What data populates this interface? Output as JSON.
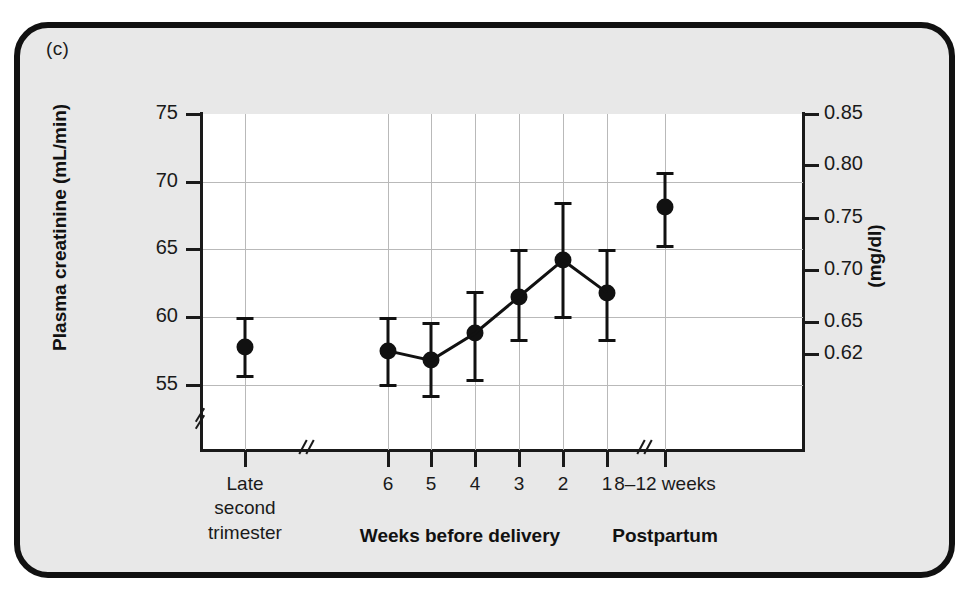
{
  "panel": {
    "label": "(c)"
  },
  "chart_data": {
    "type": "scatter",
    "title": "",
    "ylabel": "Plasma creatinine (mL/min)",
    "ylabel_right": "(mg/dl)",
    "xlabel": "",
    "ylim": [
      53,
      75
    ],
    "ylim_right": [
      0.615,
      0.85
    ],
    "grid": true,
    "legend": null,
    "axis_break_y": true,
    "axis_break_x": true,
    "yticks_left": [
      "75",
      "70",
      "65",
      "60",
      "55"
    ],
    "yticks_left_values": [
      75,
      70,
      65,
      60,
      55
    ],
    "yticks_right": [
      "0.85",
      "0.80",
      "0.75",
      "0.70",
      "0.65",
      "0.62"
    ],
    "yticks_right_values": [
      0.85,
      0.8,
      0.75,
      0.7,
      0.65,
      0.62
    ],
    "group_labels": [
      {
        "text": "Weeks before delivery",
        "x": 460
      },
      {
        "text": "Postpartum",
        "x": 665
      }
    ],
    "categories": [
      "Late second trimester",
      "6",
      "5",
      "4",
      "3",
      "2",
      "1",
      "8–12 weeks"
    ],
    "tick_labels": [
      {
        "lines": [
          "Late",
          "second",
          "trimester"
        ],
        "x": 245
      },
      {
        "lines": [
          "6"
        ],
        "x": 388
      },
      {
        "lines": [
          "5"
        ],
        "x": 431
      },
      {
        "lines": [
          "4"
        ],
        "x": 475
      },
      {
        "lines": [
          "3"
        ],
        "x": 519
      },
      {
        "lines": [
          "2"
        ],
        "x": 563
      },
      {
        "lines": [
          "1"
        ],
        "x": 607
      },
      {
        "lines": [
          "8–12 weeks"
        ],
        "x": 665
      }
    ],
    "points": [
      {
        "name": "late-second-trimester",
        "x": 245,
        "value": 57.8,
        "low": 55.6,
        "high": 60.0,
        "connected": false
      },
      {
        "name": "week-6",
        "x": 388,
        "value": 57.5,
        "low": 54.9,
        "high": 60.0,
        "connected": true
      },
      {
        "name": "week-5",
        "x": 431,
        "value": 56.8,
        "low": 54.1,
        "high": 59.6,
        "connected": true
      },
      {
        "name": "week-4",
        "x": 475,
        "value": 58.8,
        "low": 55.3,
        "high": 61.9,
        "connected": true
      },
      {
        "name": "week-3",
        "x": 519,
        "value": 61.5,
        "low": 58.2,
        "high": 65.0,
        "connected": true
      },
      {
        "name": "week-2",
        "x": 563,
        "value": 64.2,
        "low": 59.9,
        "high": 68.5,
        "connected": true
      },
      {
        "name": "week-1",
        "x": 607,
        "value": 61.8,
        "low": 58.2,
        "high": 65.0,
        "connected": true
      },
      {
        "name": "postpartum-8-12-weeks",
        "x": 665,
        "value": 68.1,
        "low": 65.2,
        "high": 70.7,
        "connected": false
      }
    ]
  }
}
